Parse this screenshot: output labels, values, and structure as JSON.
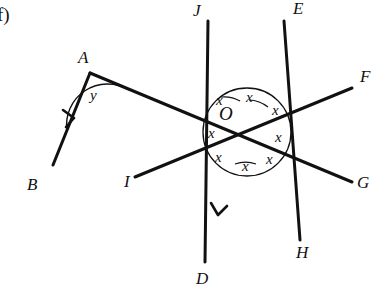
{
  "figure": {
    "part_label": "f)",
    "vertex_center_label": "O",
    "vertex_a_label": "A",
    "angle_a_label": "y",
    "center_angle_label": "x",
    "point_labels": [
      {
        "name": "A",
        "text": "A",
        "x": 78,
        "y": 49
      },
      {
        "name": "B",
        "text": "B",
        "x": 27,
        "y": 176
      },
      {
        "name": "I",
        "text": "I",
        "x": 124,
        "y": 173
      },
      {
        "name": "D",
        "text": "D",
        "x": 196,
        "y": 270
      },
      {
        "name": "J",
        "text": "J",
        "x": 193,
        "y": 2
      },
      {
        "name": "E",
        "text": "E",
        "x": 293,
        "y": 0
      },
      {
        "name": "F",
        "text": "F",
        "x": 360,
        "y": 68
      },
      {
        "name": "G",
        "text": "G",
        "x": 357,
        "y": 174
      },
      {
        "name": "H",
        "text": "H",
        "x": 296,
        "y": 244
      }
    ],
    "center_x_labels": [
      {
        "name": "x-sector-1",
        "text": "x",
        "x": 216,
        "y": 93
      },
      {
        "name": "x-sector-2",
        "text": "x",
        "x": 246,
        "y": 90
      },
      {
        "name": "x-sector-3",
        "text": "x",
        "x": 272,
        "y": 103
      },
      {
        "name": "x-sector-4",
        "text": "x",
        "x": 275,
        "y": 130
      },
      {
        "name": "x-sector-5",
        "text": "x",
        "x": 266,
        "y": 152
      },
      {
        "name": "x-sector-6",
        "text": "x",
        "x": 242,
        "y": 159
      },
      {
        "name": "x-sector-7",
        "text": "x",
        "x": 215,
        "y": 150
      },
      {
        "name": "x-sector-8",
        "text": "x",
        "x": 208,
        "y": 126
      }
    ],
    "geometry": {
      "center": {
        "x": 247,
        "y": 132
      },
      "circle_radius": 44,
      "vertex_a": {
        "x": 90,
        "y": 73
      },
      "stroke_color": "#111111"
    }
  }
}
